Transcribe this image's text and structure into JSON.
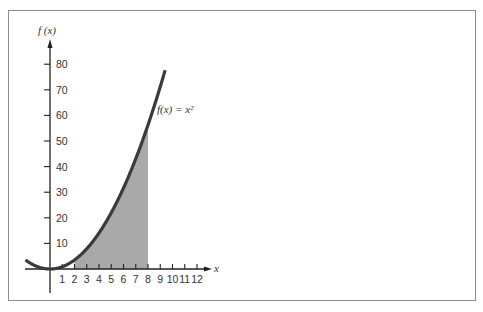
{
  "chart_data": {
    "type": "area",
    "title": "",
    "function": "f(x) = x^2",
    "curve_label": "f(x) = x²",
    "xlabel": "x",
    "ylabel": "f(x)",
    "x_ticks": [
      1,
      2,
      3,
      4,
      5,
      6,
      7,
      8,
      9,
      10,
      11,
      12
    ],
    "y_ticks": [
      10,
      20,
      30,
      40,
      50,
      60,
      70,
      80
    ],
    "xlim": [
      -2,
      13
    ],
    "ylim": [
      0,
      85
    ],
    "curve_domain": [
      -2,
      9.4
    ],
    "shaded_region": {
      "x_from": 2,
      "x_to": 8,
      "description": "area under f(x) = x^2 between x = 2 and x = 8"
    },
    "sample_points": {
      "x": [
        -2,
        -1,
        0,
        1,
        2,
        3,
        4,
        5,
        6,
        7,
        8,
        9
      ],
      "y": [
        4,
        1,
        0,
        1,
        4,
        9,
        16,
        25,
        36,
        49,
        64,
        81
      ]
    },
    "grid": false,
    "legend": null
  },
  "colors": {
    "curve": "#3a3a3a",
    "shading": "#a9a9a9",
    "axes": "#222222",
    "frame": "#8c8c8c"
  },
  "labels": {
    "y_axis": "f (x)",
    "x_axis": "x",
    "curve": "f(x) = x²"
  }
}
